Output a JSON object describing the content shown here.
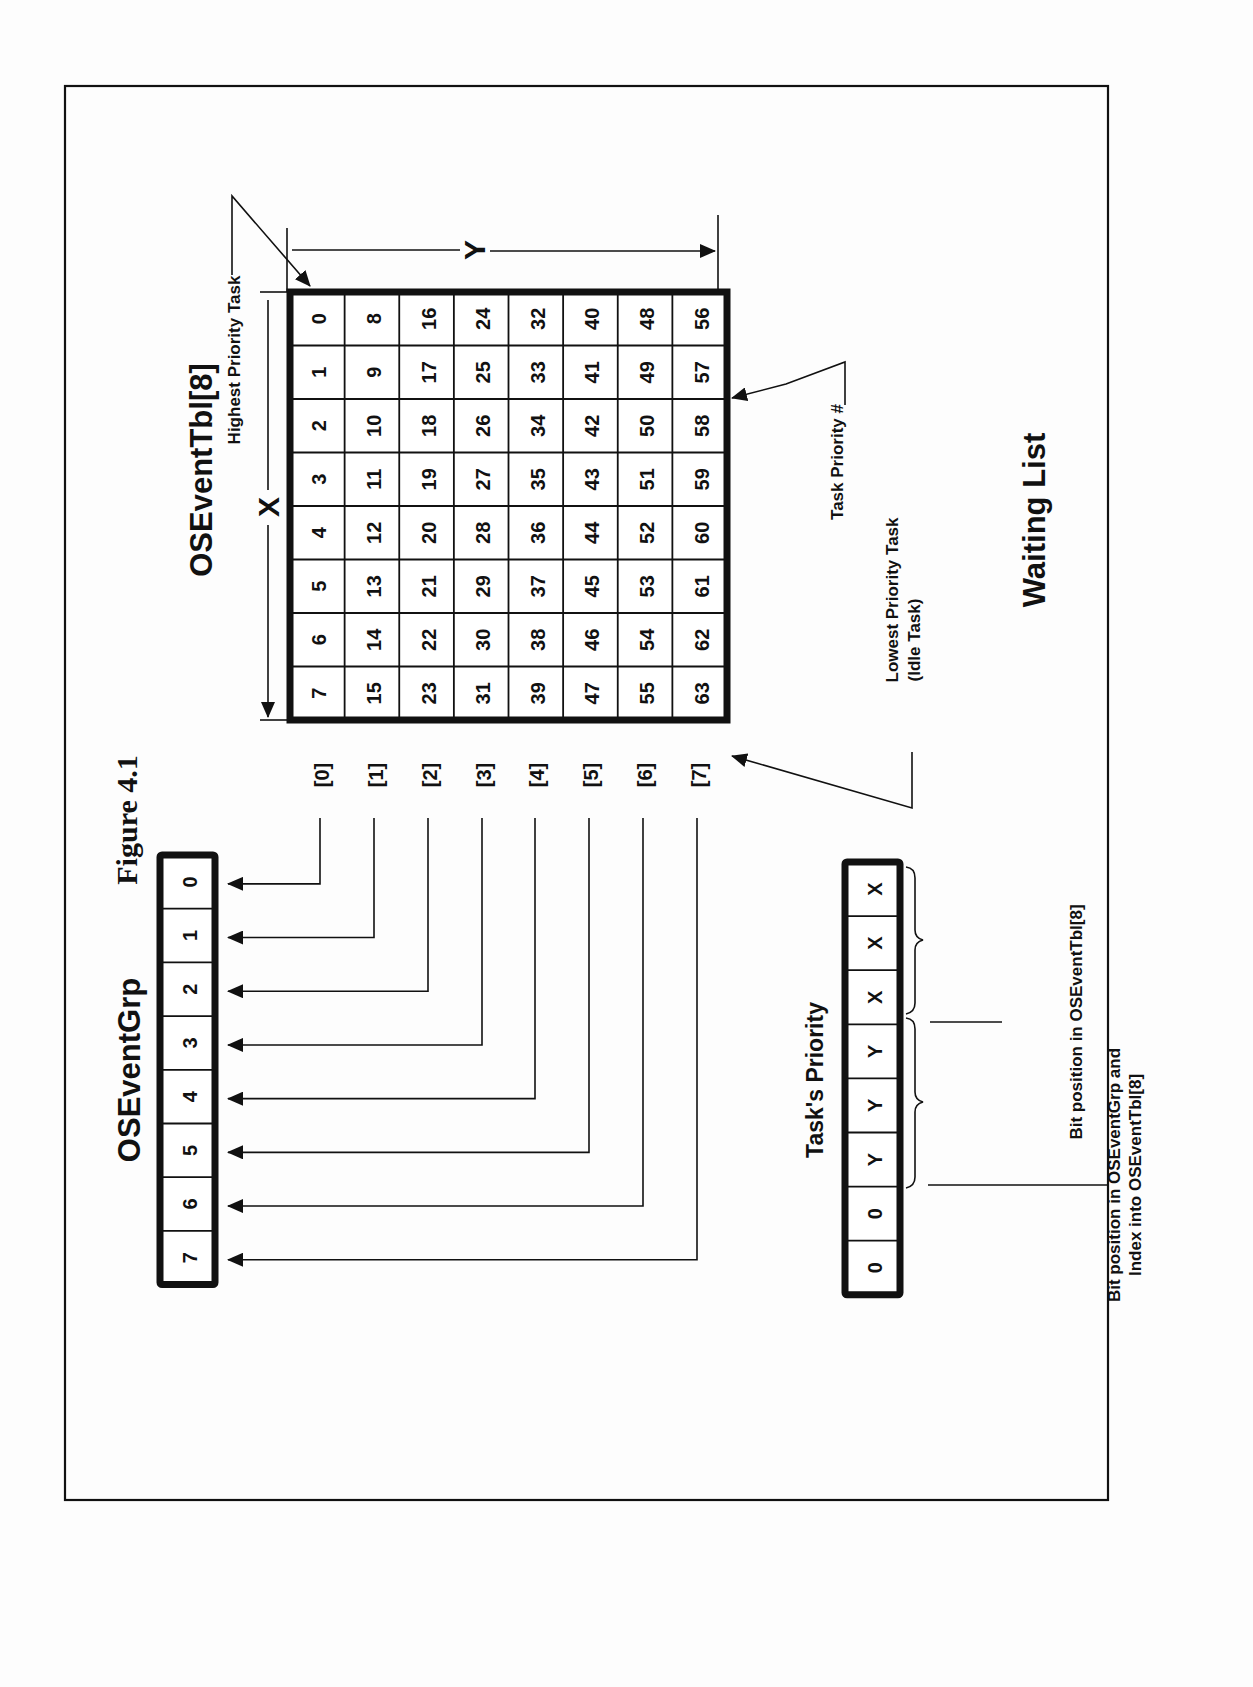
{
  "figure": {
    "caption": "Figure 4.1",
    "title": "Waiting List",
    "orientation": "rotated-90-ccw"
  },
  "event_table": {
    "title": "OSEventTbl[8]",
    "axis_x_label": "X",
    "axis_y_label": "Y",
    "highest_priority_label": "Highest Priority Task",
    "task_priority_label": "Task Priority #",
    "lowest_priority_label": "Lowest Priority Task",
    "lowest_priority_sub": "(Idle Task)",
    "rows": [
      [
        0,
        1,
        2,
        3,
        4,
        5,
        6,
        7
      ],
      [
        8,
        9,
        10,
        11,
        12,
        13,
        14,
        15
      ],
      [
        16,
        17,
        18,
        19,
        20,
        21,
        22,
        23
      ],
      [
        24,
        25,
        26,
        27,
        28,
        29,
        30,
        31
      ],
      [
        32,
        33,
        34,
        35,
        36,
        37,
        38,
        39
      ],
      [
        40,
        41,
        42,
        43,
        44,
        45,
        46,
        47
      ],
      [
        48,
        49,
        50,
        51,
        52,
        53,
        54,
        55
      ],
      [
        56,
        57,
        58,
        59,
        60,
        61,
        62,
        63
      ]
    ],
    "row_indices": [
      "[0]",
      "[1]",
      "[2]",
      "[3]",
      "[4]",
      "[5]",
      "[6]",
      "[7]"
    ]
  },
  "event_group": {
    "title": "OSEventGrp",
    "bits": [
      "0",
      "1",
      "2",
      "3",
      "4",
      "5",
      "6",
      "7"
    ]
  },
  "task_priority": {
    "title": "Task's Priority",
    "bits": [
      "X",
      "X",
      "X",
      "Y",
      "Y",
      "Y",
      "0",
      "0"
    ],
    "x_brace_label": "Bit position in OSEventTbl[8]",
    "y_brace_label_line1": "Bit position in OSEventGrp and",
    "y_brace_label_line2": "Index into OSEventTbl[8]"
  }
}
